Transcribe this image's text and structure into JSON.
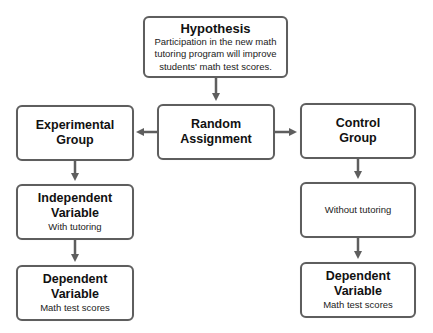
{
  "diagram": {
    "hypothesis": {
      "title": "Hypothesis",
      "text_lines": [
        "Participation in the new math",
        "tutoring program will improve",
        "students' math test scores."
      ]
    },
    "random_assignment": {
      "title_lines": [
        "Random",
        "Assignment"
      ]
    },
    "experimental_group": {
      "title_lines": [
        "Experimental",
        "Group"
      ]
    },
    "control_group": {
      "title_lines": [
        "Control",
        "Group"
      ]
    },
    "independent_variable": {
      "title_lines": [
        "Independent",
        "Variable"
      ],
      "text": "With tutoring"
    },
    "control_condition": {
      "text": "Without tutoring"
    },
    "dependent_variable_left": {
      "title_lines": [
        "Dependent",
        "Variable"
      ],
      "text": "Math test scores"
    },
    "dependent_variable_right": {
      "title_lines": [
        "Dependent",
        "Variable"
      ],
      "text": "Math test scores"
    },
    "colors": {
      "border": "#5e5e5e",
      "arrow": "#5e5e5e",
      "background": "#ffffff"
    },
    "edges": [
      {
        "from": "Hypothesis",
        "to": "Random Assignment"
      },
      {
        "from": "Random Assignment",
        "to": "Experimental Group"
      },
      {
        "from": "Random Assignment",
        "to": "Control Group"
      },
      {
        "from": "Experimental Group",
        "to": "Independent Variable"
      },
      {
        "from": "Independent Variable",
        "to": "Dependent Variable (left)"
      },
      {
        "from": "Control Group",
        "to": "Without tutoring"
      },
      {
        "from": "Without tutoring",
        "to": "Dependent Variable (right)"
      }
    ]
  }
}
